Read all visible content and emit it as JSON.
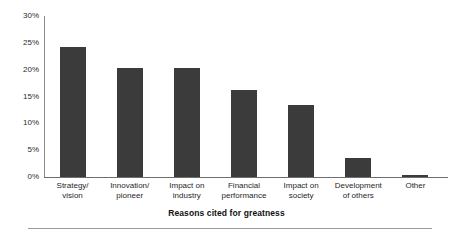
{
  "chart_data": {
    "type": "bar",
    "title": "",
    "xlabel": "Reasons cited for greatness",
    "ylabel": "",
    "categories": [
      "Strategy/ vision",
      "Innovation/ pioneer",
      "Impact on industry",
      "Financial performance",
      "Impact on society",
      "Development of others",
      "Other"
    ],
    "category_lines": [
      [
        "Strategy/",
        "vision"
      ],
      [
        "Innovation/",
        "pioneer"
      ],
      [
        "Impact on",
        "industry"
      ],
      [
        "Financial",
        "performance"
      ],
      [
        "Impact on",
        "society"
      ],
      [
        "Development",
        "of others"
      ],
      [
        "Other",
        ""
      ]
    ],
    "values": [
      24.2,
      20.4,
      20.4,
      16.3,
      13.5,
      3.6,
      0.4
    ],
    "value_labels": [
      "24.2%",
      "20.4%",
      "20.4%",
      "16.3%",
      "13.5%",
      "3.6%",
      "0.4%"
    ],
    "ylim": [
      0,
      30
    ],
    "ytick_values": [
      30,
      25,
      20,
      15,
      10,
      5,
      0
    ],
    "ytick_labels": [
      "30%",
      "25%",
      "20%",
      "15%",
      "10%",
      "5%",
      "0%"
    ],
    "grid": false,
    "legend": false,
    "legend_position": "none",
    "bar_color": "#3b3b3b",
    "axis_color": "#6e6e6e",
    "background_color": "#ffffff",
    "text_color": "#1a1a1a"
  }
}
